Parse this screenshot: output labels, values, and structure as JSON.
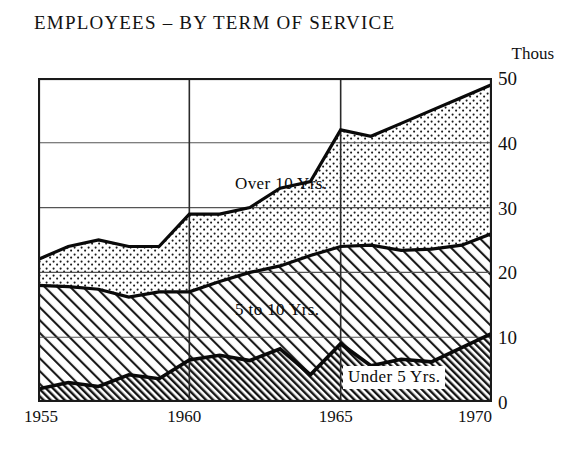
{
  "header": {
    "title": "EMPLOYEES – BY TERM OF SERVICE",
    "units_label": "Thous"
  },
  "axes": {
    "y_ticks": [
      "0",
      "10",
      "20",
      "30",
      "40",
      "50"
    ],
    "x_ticks": [
      "1955",
      "1960",
      "1965",
      "1970"
    ]
  },
  "series_labels": {
    "over10": "Over 10 Yrs.",
    "five_to_ten": "5 to 10 Yrs.",
    "under5": "Under 5 Yrs."
  },
  "colors": {
    "ink": "#0a0a0a",
    "gridline": "#555555",
    "frame": "#1a1a1a",
    "background": "#ffffff"
  },
  "chart_data": {
    "type": "area",
    "stacked": true,
    "title": "EMPLOYEES – BY TERM OF SERVICE",
    "subtitle": "",
    "xlabel": "",
    "ylabel": "Thous",
    "ylim": [
      0,
      50
    ],
    "xlim": [
      1955,
      1970
    ],
    "grid": true,
    "legend_position": "inline-band-labels",
    "x": [
      1955,
      1956,
      1957,
      1958,
      1959,
      1960,
      1961,
      1962,
      1963,
      1964,
      1965,
      1966,
      1967,
      1968,
      1969,
      1970
    ],
    "series": [
      {
        "name": "Under 5 Yrs.",
        "fill": "dense-hatch",
        "values": [
          2.0,
          3.0,
          2.4,
          4.2,
          3.6,
          6.5,
          7.2,
          6.4,
          8.2,
          4.2,
          9.0,
          5.6,
          6.6,
          6.2,
          8.4,
          10.6
        ]
      },
      {
        "name": "5 to 10 Yrs.",
        "fill": "light-hatch",
        "values": [
          16.0,
          14.8,
          15.0,
          12.0,
          13.4,
          10.5,
          11.4,
          13.6,
          12.8,
          18.4,
          15.0,
          18.6,
          16.8,
          17.4,
          15.8,
          15.4
        ]
      },
      {
        "name": "Over 10 Yrs.",
        "fill": "stipple",
        "values": [
          4.0,
          6.2,
          7.6,
          7.8,
          7.0,
          12.0,
          10.4,
          10.0,
          12.0,
          11.4,
          18.0,
          16.8,
          19.6,
          21.4,
          22.8,
          23.0
        ]
      }
    ],
    "totals": [
      22.0,
      24.0,
      25.0,
      24.0,
      24.0,
      29.0,
      29.0,
      30.0,
      33.0,
      34.0,
      42.0,
      41.0,
      43.0,
      45.0,
      47.0,
      49.0
    ],
    "cum_under5": [
      2.0,
      3.0,
      2.4,
      4.2,
      3.6,
      6.5,
      7.2,
      6.4,
      8.2,
      4.2,
      9.0,
      5.6,
      6.6,
      6.2,
      8.4,
      10.6
    ],
    "cum_thru_ten": [
      18.0,
      17.8,
      17.4,
      16.2,
      17.0,
      17.0,
      18.6,
      20.0,
      21.0,
      22.6,
      24.0,
      24.2,
      23.4,
      23.6,
      24.2,
      26.0
    ]
  }
}
